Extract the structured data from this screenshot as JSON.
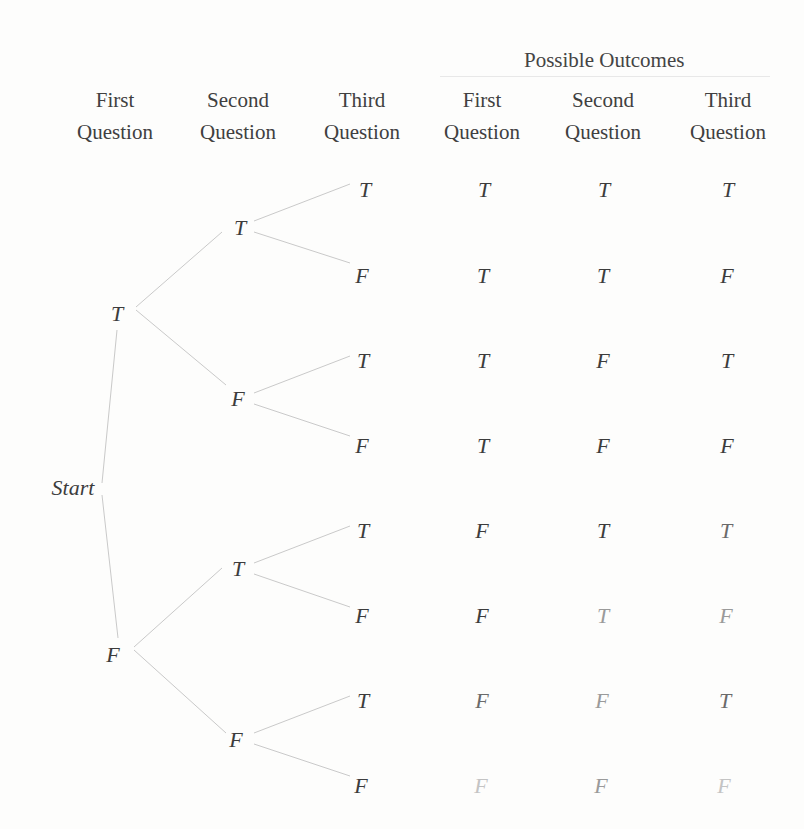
{
  "header": {
    "possible_outcomes": "Possible Outcomes",
    "columns": [
      {
        "line1": "First",
        "line2": "Question"
      },
      {
        "line1": "Second",
        "line2": "Question"
      },
      {
        "line1": "Third",
        "line2": "Question"
      },
      {
        "line1": "First",
        "line2": "Question"
      },
      {
        "line1": "Second",
        "line2": "Question"
      },
      {
        "line1": "Third",
        "line2": "Question"
      }
    ]
  },
  "tree": {
    "root": "Start",
    "level1": [
      "T",
      "F"
    ],
    "level2": [
      "T",
      "F",
      "T",
      "F"
    ],
    "level3": [
      "T",
      "F",
      "T",
      "F",
      "T",
      "F",
      "T",
      "F"
    ]
  },
  "outcomes": [
    [
      "T",
      "T",
      "T"
    ],
    [
      "T",
      "T",
      "F"
    ],
    [
      "T",
      "F",
      "T"
    ],
    [
      "T",
      "F",
      "F"
    ],
    [
      "F",
      "T",
      "T"
    ],
    [
      "F",
      "T",
      "F"
    ],
    [
      "F",
      "F",
      "T"
    ],
    [
      "F",
      "F",
      "F"
    ]
  ],
  "colors": {
    "text": "#3c3c3c",
    "lines": "#c8c8c8",
    "background": "#fdfdfc"
  }
}
